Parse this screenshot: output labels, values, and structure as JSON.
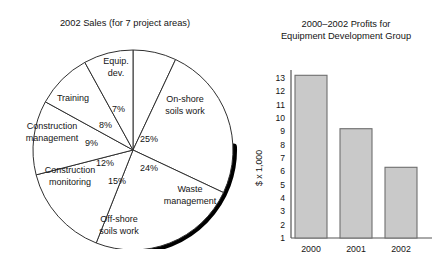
{
  "pie": {
    "title": "2002 Sales (for 7 project areas)",
    "labels": {
      "equip_dev": "Equip.\ndev.",
      "equip_dev_line1": "Equip.",
      "equip_dev_line2": "dev.",
      "onshore_line1": "On-shore",
      "onshore_line2": "soils work",
      "waste_line1": "Waste",
      "waste_line2": "management",
      "offshore_line1": "Off-shore",
      "offshore_line2": "soils work",
      "constr_mon_line1": "Construction",
      "constr_mon_line2": "monitoring",
      "constr_mgmt_line1": "Construction",
      "constr_mgmt_line2": "management",
      "training": "Training"
    },
    "percents": {
      "equip_dev": "7%",
      "onshore": "25%",
      "waste": "24%",
      "offshore": "15%",
      "constr_mon": "12%",
      "constr_mgmt": "9%",
      "training": "8%"
    }
  },
  "bar": {
    "title_line1": "2000–2002 Profits for",
    "title_line2": "Equipment Development Group",
    "ylabel": "$ x 1,000"
  },
  "chart_data": [
    {
      "type": "pie",
      "title": "2002 Sales (for 7 project areas)",
      "start_angle_deg": 0,
      "direction": "clockwise",
      "legend": "none",
      "labels": [
        "Equip. dev.",
        "On-shore soils work",
        "Waste management",
        "Off-shore soils work",
        "Construction monitoring",
        "Construction management",
        "Training"
      ],
      "values": [
        7,
        25,
        24,
        15,
        12,
        9,
        8
      ],
      "value_labels": [
        "7%",
        "25%",
        "24%",
        "15%",
        "12%",
        "9%",
        "8%"
      ],
      "units": "percent",
      "slice_fill": "#ffffff",
      "slice_stroke": "#303030",
      "shadow": "thick black arc on lower-right rim"
    },
    {
      "type": "bar",
      "title": "2000–2002 Profits for Equipment Development Group",
      "xlabel": "",
      "ylabel": "$ x 1,000",
      "categories": [
        "2000",
        "2001",
        "2002"
      ],
      "values": [
        13.2,
        9.2,
        6.3
      ],
      "ylim": [
        1,
        13.6
      ],
      "yticks": [
        1,
        2,
        3,
        4,
        5,
        6,
        7,
        8,
        9,
        10,
        11,
        12,
        13
      ],
      "ytick_labels": [
        "1",
        "2",
        "3",
        "4",
        "5",
        "6",
        "7",
        "8",
        "9",
        "10",
        "11",
        "12",
        "13"
      ],
      "grid": false,
      "bar_fill": "#c9c9c9",
      "bar_stroke": "#6e6e6e",
      "legend": "none"
    }
  ]
}
